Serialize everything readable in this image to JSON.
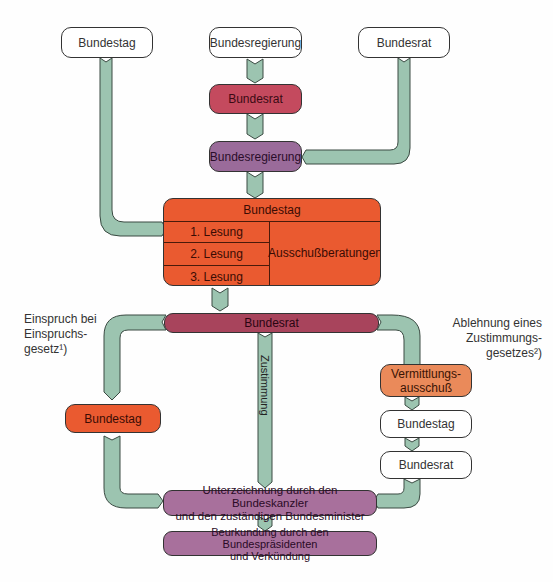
{
  "top_row": {
    "bundestag": "Bundestag",
    "bundesregierung": "Bundesregierung",
    "bundesrat": "Bundesrat"
  },
  "chain": {
    "bundesrat": "Bundesrat",
    "bundesregierung": "Bundesregierung"
  },
  "bundestag_block": {
    "title": "Bundestag",
    "readings": [
      "1. Lesung",
      "2. Lesung",
      "3. Lesung"
    ],
    "committee": "Ausschußberatungen"
  },
  "bundesrat_decision": "Bundesrat",
  "left_branch": {
    "note_lines": [
      "Einspruch bei",
      "Einspruchs-",
      "gesetz¹)"
    ],
    "bundestag": "Bundestag"
  },
  "center_branch": {
    "label": "Zustimmung"
  },
  "right_branch": {
    "note_lines": [
      "Ablehnung eines",
      "Zustimmungs-",
      "gesetzes²)"
    ],
    "vermittlung_lines": [
      "Vermittlungs-",
      "ausschuß"
    ],
    "bundestag": "Bundestag",
    "bundesrat": "Bundesrat"
  },
  "signing": {
    "lines": [
      "Unterzeichnung durch den Bundeskanzler",
      "und den zuständigen Bundesminister"
    ]
  },
  "promulgation": {
    "lines": [
      "Beurkundung durch den Bundespräsidenten",
      "und Verkündung"
    ]
  },
  "colors": {
    "connector": "#9cc4b0",
    "bundesrat_red": "#c44a5e",
    "bundesregierung_purple": "#9a6b9a",
    "bundestag_orange": "#ea5a30",
    "vermittlung_orange": "#ea8a5a",
    "decision_maroon": "#a8445c",
    "signing_mauve": "#a8709c"
  }
}
